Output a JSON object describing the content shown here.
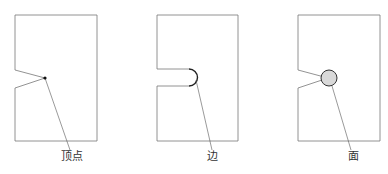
{
  "diagram": {
    "type": "geometric-feature-selection",
    "colors": {
      "stroke": "#777777",
      "highlight_stroke": "#222222",
      "face_fill": "#d9d9d9",
      "vertex_dot": "#111111",
      "leader": "#555555"
    },
    "panels": [
      {
        "id": "vertex",
        "label": "顶点",
        "shape": "rectangle-with-v-notch",
        "highlight": "vertex-dot",
        "label_pos": [
          72,
          157
        ]
      },
      {
        "id": "edge",
        "label": "边",
        "shape": "rectangle-with-u-slot",
        "highlight": "arc-edge",
        "label_pos": [
          212,
          157
        ]
      },
      {
        "id": "face",
        "label": "面",
        "shape": "rectangle-with-v-notch",
        "highlight": "circular-face",
        "label_pos": [
          353,
          157
        ]
      }
    ]
  }
}
